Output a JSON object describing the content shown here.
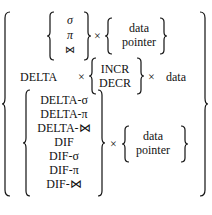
{
  "formula": {
    "row1": {
      "ops": [
        "σ",
        "π",
        "⋈"
      ],
      "times": "×",
      "targets": [
        "data",
        "pointer"
      ]
    },
    "row2": {
      "prefix": "DELTA",
      "times1": "×",
      "ops": [
        "INCR",
        "DECR"
      ],
      "times2": "×",
      "target": "data"
    },
    "row3": {
      "ops": [
        "DELTA-σ",
        "DELTA-π",
        "DELTA-⋈",
        "DIF",
        "DIF-σ",
        "DIF-π",
        "DIF-⋈"
      ],
      "times": "×",
      "targets": [
        "data",
        "pointer"
      ]
    }
  }
}
